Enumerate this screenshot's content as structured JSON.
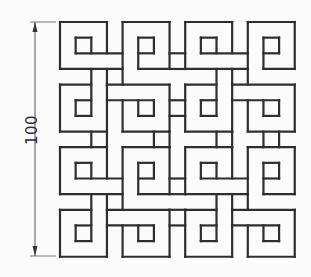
{
  "diagram": {
    "dimension": {
      "label": "100",
      "orientation": "vertical",
      "line_x": 35,
      "y_top": 22,
      "y_bottom": 256
    },
    "grid": {
      "origin_x": 60,
      "origin_y": 22,
      "unit_px": 15.65,
      "units": 15
    },
    "colors": {
      "stroke": "#2e2e2e",
      "dimension_stroke": "#555555",
      "background": "#fbfbfb"
    },
    "quadrant_offsets": [
      [
        0,
        0
      ],
      [
        8,
        0
      ],
      [
        0,
        8
      ],
      [
        8,
        8
      ]
    ],
    "tile_segments": [
      [
        0,
        0,
        3,
        0
      ],
      [
        0,
        0,
        0,
        3
      ],
      [
        0,
        3,
        4,
        3
      ],
      [
        3,
        0,
        3,
        2
      ],
      [
        1,
        1,
        2,
        1
      ],
      [
        1,
        1,
        1,
        2
      ],
      [
        2,
        1,
        2,
        2
      ],
      [
        1,
        2,
        4,
        2
      ],
      [
        4,
        0,
        7,
        0
      ],
      [
        4,
        0,
        4,
        4
      ],
      [
        7,
        0,
        7,
        3
      ],
      [
        5,
        3,
        7,
        3
      ],
      [
        5,
        1,
        6,
        1
      ],
      [
        6,
        1,
        6,
        2
      ],
      [
        5,
        1,
        5,
        3
      ],
      [
        5,
        2,
        6,
        2
      ],
      [
        0,
        4,
        2,
        4
      ],
      [
        0,
        4,
        0,
        7
      ],
      [
        0,
        7,
        3,
        7
      ],
      [
        3,
        4,
        3,
        7
      ],
      [
        2,
        3,
        2,
        6
      ],
      [
        1,
        5,
        2,
        5
      ],
      [
        1,
        5,
        1,
        6
      ],
      [
        1,
        6,
        2,
        6
      ],
      [
        3,
        4,
        7,
        4
      ],
      [
        4,
        5,
        4,
        7
      ],
      [
        4,
        7,
        7,
        7
      ],
      [
        7,
        4,
        7,
        7
      ],
      [
        3,
        5,
        6,
        5
      ],
      [
        6,
        5,
        6,
        6
      ],
      [
        5,
        6,
        6,
        6
      ],
      [
        5,
        5,
        5,
        6
      ],
      [
        3,
        3,
        3,
        4
      ]
    ],
    "link_segments": [
      [
        6,
        7,
        6,
        8
      ],
      [
        7,
        7,
        7,
        8
      ],
      [
        2,
        7,
        2,
        8
      ],
      [
        3,
        7,
        3,
        8
      ],
      [
        10,
        7,
        10,
        8
      ],
      [
        11,
        7,
        11,
        8
      ],
      [
        13,
        7,
        13,
        8
      ],
      [
        14,
        7,
        14,
        8
      ],
      [
        7,
        2,
        8,
        2
      ],
      [
        7,
        3,
        8,
        3
      ],
      [
        7,
        5,
        8,
        5
      ],
      [
        7,
        6,
        8,
        6
      ],
      [
        7,
        10,
        8,
        10
      ],
      [
        7,
        11,
        8,
        11
      ],
      [
        7,
        12,
        8,
        12
      ],
      [
        7,
        13,
        8,
        13
      ]
    ]
  }
}
